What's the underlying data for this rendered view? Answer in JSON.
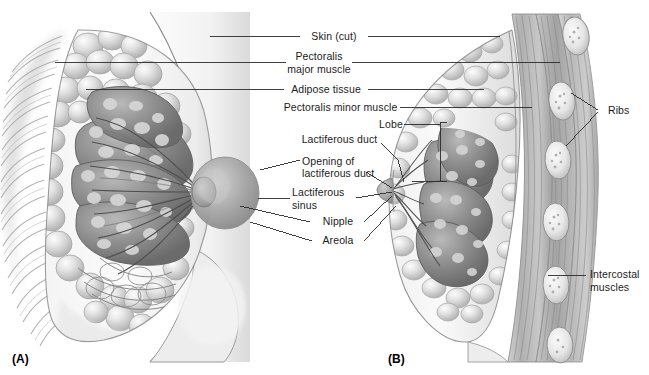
{
  "figure": {
    "background_color": "#ffffff",
    "line_color": "#2b2b2b",
    "text_color": "#1b1b1b"
  },
  "panels": [
    {
      "id": "A",
      "tag": "(A)",
      "description": "Anterior cutaway view of the breast showing lobes, adipose tissue and pectoral muscles"
    },
    {
      "id": "B",
      "tag": "(B)",
      "description": "Sagittal section of the breast showing ribs, intercostal muscles, lobes and ducts"
    }
  ],
  "labels": [
    {
      "id": "skin-cut",
      "text": "Skin (cut)"
    },
    {
      "id": "pectoralis-major",
      "line1": "Pectoralis",
      "line2": "major muscle"
    },
    {
      "id": "adipose-tissue",
      "text": "Adipose tissue"
    },
    {
      "id": "pectoralis-minor",
      "text": "Pectoralis minor muscle"
    },
    {
      "id": "lobe",
      "text": "Lobe"
    },
    {
      "id": "lactiferous-duct",
      "text": "Lactiferous duct"
    },
    {
      "id": "opening-lactiferous-duct",
      "line1": "Opening of",
      "line2": "lactiferous duct"
    },
    {
      "id": "lactiferous-sinus",
      "line1": "Lactiferous",
      "line2": "sinus"
    },
    {
      "id": "nipple",
      "text": "Nipple"
    },
    {
      "id": "areola",
      "text": "Areola"
    },
    {
      "id": "ribs",
      "text": "Ribs"
    },
    {
      "id": "intercostal-muscles",
      "line1": "Intercostal",
      "line2": "muscles"
    }
  ]
}
